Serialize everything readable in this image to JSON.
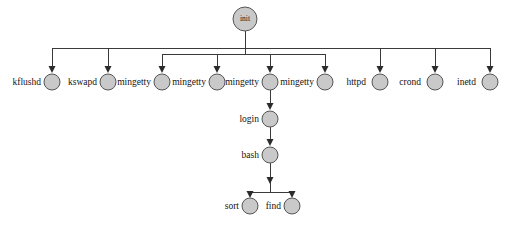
{
  "diagram": {
    "type": "tree",
    "canvas": {
      "width": 509,
      "height": 226
    },
    "colors": {
      "background": "#ffffff",
      "node_fill": "#c9c9c9",
      "node_stroke": "#555555",
      "edge": "#3a3a3a",
      "text": "#141414"
    },
    "root": {
      "id": "init",
      "label": "init",
      "label_position": "inside",
      "cx": 245,
      "cy": 19,
      "r": 12
    },
    "bus_lines": [
      {
        "name": "outer-bus",
        "y": 48,
        "x1": 52,
        "x2": 490
      },
      {
        "name": "inner-bus",
        "y": 54,
        "x1": 162,
        "x2": 325
      },
      {
        "name": "bash-children-bus",
        "y": 192,
        "x1": 250,
        "x2": 292
      }
    ],
    "nodes": [
      {
        "id": "kflushd",
        "label": "kflushd",
        "cx": 52,
        "cy": 82,
        "r": 8,
        "label_position": "left",
        "bus": "outer-bus"
      },
      {
        "id": "kswapd",
        "label": "kswapd",
        "cx": 108,
        "cy": 82,
        "r": 8,
        "label_position": "left",
        "bus": "outer-bus"
      },
      {
        "id": "mingetty1",
        "label": "mingetty",
        "cx": 162,
        "cy": 82,
        "r": 8,
        "label_position": "left",
        "bus": "inner-bus"
      },
      {
        "id": "mingetty2",
        "label": "mingetty",
        "cx": 217,
        "cy": 82,
        "r": 8,
        "label_position": "left",
        "bus": "inner-bus"
      },
      {
        "id": "mingetty3",
        "label": "mingetty",
        "cx": 270,
        "cy": 82,
        "r": 8,
        "label_position": "left",
        "bus": "inner-bus"
      },
      {
        "id": "mingetty4",
        "label": "mingetty",
        "cx": 325,
        "cy": 82,
        "r": 8,
        "label_position": "left",
        "bus": "inner-bus"
      },
      {
        "id": "httpd",
        "label": "httpd",
        "cx": 380,
        "cy": 82,
        "r": 8,
        "label_position": "left",
        "bus": "outer-bus"
      },
      {
        "id": "crond",
        "label": "crond",
        "cx": 435,
        "cy": 82,
        "r": 8,
        "label_position": "left",
        "bus": "outer-bus"
      },
      {
        "id": "inetd",
        "label": "inetd",
        "cx": 490,
        "cy": 82,
        "r": 8,
        "label_position": "left",
        "bus": "outer-bus"
      },
      {
        "id": "login",
        "label": "login",
        "cx": 270,
        "cy": 119,
        "r": 8,
        "label_position": "left",
        "bus": null
      },
      {
        "id": "bash",
        "label": "bash",
        "cx": 270,
        "cy": 155,
        "r": 8,
        "label_position": "left",
        "bus": null
      },
      {
        "id": "sort",
        "label": "sort",
        "cx": 250,
        "cy": 206,
        "r": 8,
        "label_position": "left",
        "bus": "bash-children-bus"
      },
      {
        "id": "find",
        "label": "find",
        "cx": 292,
        "cy": 206,
        "r": 8,
        "label_position": "left",
        "bus": "bash-children-bus"
      }
    ],
    "edges": [
      {
        "from": "init",
        "to": "outer-bus",
        "kind": "stem"
      },
      {
        "from": "init",
        "to": "inner-bus",
        "kind": "stem"
      },
      {
        "from": "mingetty3",
        "to": "login",
        "kind": "direct"
      },
      {
        "from": "login",
        "to": "bash",
        "kind": "direct"
      },
      {
        "from": "bash",
        "to": "bash-children-bus",
        "kind": "stem"
      }
    ],
    "labels": {
      "init": "init",
      "kflushd": "kflushd",
      "kswapd": "kswapd",
      "mingetty1": "mingetty",
      "mingetty2": "mingetty",
      "mingetty3": "mingetty",
      "mingetty4": "mingetty",
      "httpd": "httpd",
      "crond": "crond",
      "inetd": "inetd",
      "login": "login",
      "bash": "bash",
      "sort": "sort",
      "find": "find"
    }
  }
}
